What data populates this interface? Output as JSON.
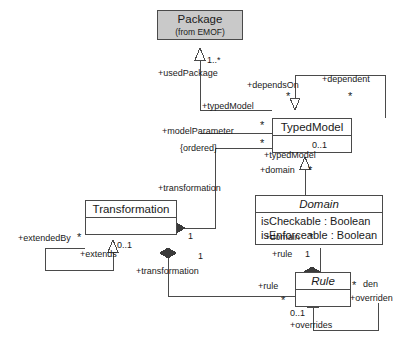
{
  "diagram": {
    "kind": "uml-class-diagram",
    "width": 414,
    "height": 353,
    "background": "#ffffff",
    "line_color": "#4a4a4a",
    "text_color": "#1a1a1a",
    "shaded_fill": "#c9c9c9"
  },
  "classes": [
    {
      "id": "package",
      "name": "Package",
      "stereotype": "(from EMOF)",
      "abstract": false,
      "shaded": true,
      "attributes": []
    },
    {
      "id": "typedmodel",
      "name": "TypedModel",
      "abstract": false,
      "shaded": false,
      "attributes": []
    },
    {
      "id": "domain",
      "name": "Domain",
      "abstract": true,
      "shaded": false,
      "attributes": [
        "isCheckable : Boolean",
        "isEnforceable : Boolean"
      ]
    },
    {
      "id": "transformation",
      "name": "Transformation",
      "abstract": false,
      "shaded": false,
      "attributes": []
    },
    {
      "id": "rule",
      "name": "Rule",
      "abstract": true,
      "shaded": false,
      "attributes": []
    }
  ],
  "role_labels": {
    "used_package": "+usedPackage",
    "depends_on": "+dependsOn",
    "dependent": "+dependent",
    "typed_model_pkg": "+typedModel",
    "model_parameter": "+modelParameter",
    "ordered_constraint": "{ordered}",
    "typed_model_domain": "+typedModel",
    "domain_typedmodel": "+domain",
    "transformation_param": "+transformation",
    "extended_by": "+extendedBy",
    "extends": "+extends",
    "transformation_rule": "+transformation",
    "domain_rule": "+domain",
    "rule_domain": "+rule",
    "rule_transformation": "+rule",
    "overriden": "+overriden",
    "overrides": "+overrides",
    "den_clipped": "den"
  },
  "multiplicities": {
    "package_one_or_more": "1..*",
    "depends_on_star": "*",
    "dependent_star": "*",
    "typedmodel_star_upper": "*",
    "typedmodel_star_lower": "*",
    "typedmodel_zero_one": "0..1",
    "domain_star": "*",
    "transformation_one_param": "1",
    "extended_by_star": "*",
    "extends_zero_one": "0..1",
    "transformation_one_rule": "1",
    "domain_rule_star": "*",
    "rule_one": "1",
    "rule_star_left": "*",
    "overriden_star": "*",
    "overrides_zero_one": "0..1"
  }
}
